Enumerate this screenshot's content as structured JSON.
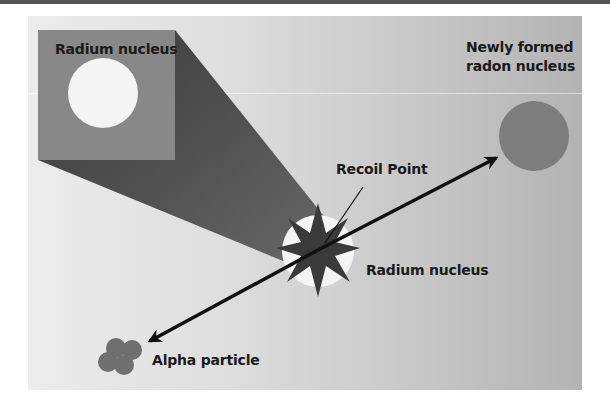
{
  "diagram": {
    "type": "alpha decay illustration",
    "labels": {
      "inset_title": "Radium nucleus",
      "radon": [
        "Newly formed",
        "radon nucleus"
      ],
      "recoil": "Recoil Point",
      "center_nucleus": "Radium nucleus",
      "alpha": "Alpha particle"
    },
    "colors": {
      "panel_light": "#ececec",
      "panel_dark": "#b3b3b3",
      "inset_box": "#888888",
      "cone": "#4a4a4a",
      "star": "#3a3a3a",
      "nucleus_white": "#f4f4f4",
      "radon": "#7d7d7d",
      "alpha": "#6f6f6f",
      "arrow": "#111111"
    }
  }
}
